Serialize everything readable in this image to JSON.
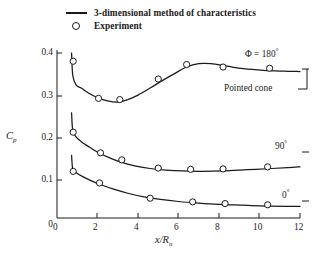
{
  "legend": {
    "items": [
      {
        "symbol": "line",
        "label": "3-dimensional method of characteristics"
      },
      {
        "symbol": "circle",
        "label": "Experiment"
      }
    ]
  },
  "axes": {
    "y": {
      "label_main": "C",
      "label_sub": "p",
      "ticks": [
        "0.4",
        "0.3",
        "0.2",
        "0.1",
        "0"
      ],
      "tick_values": [
        0.4,
        0.3,
        0.2,
        0.1,
        0.0
      ],
      "range": [
        0,
        0.4
      ]
    },
    "x": {
      "label_main": "x/R",
      "label_sub": "n",
      "ticks": [
        "0",
        "2",
        "4",
        "6",
        "8",
        "10",
        "12"
      ],
      "tick_values": [
        0,
        2,
        4,
        6,
        8,
        10,
        12
      ],
      "range": [
        0,
        12
      ]
    }
  },
  "annotations": {
    "phi180": {
      "text": "Φ = 180",
      "degree": "°"
    },
    "phi90": {
      "text": "90",
      "degree": "°"
    },
    "phi0": {
      "text": "0",
      "degree": "°"
    },
    "pointed_cone": "Pointed cone"
  },
  "chart_data": {
    "type": "line",
    "title": "",
    "xlabel": "x/R_n",
    "ylabel": "C_p",
    "xlim": [
      0,
      12
    ],
    "ylim": [
      0,
      0.4
    ],
    "grid": false,
    "legend_position": "top",
    "series": [
      {
        "name": "3-dimensional method of characteristics, Φ = 180°",
        "style": "line",
        "points": [
          [
            0.72,
            0.4
          ],
          [
            0.78,
            0.345
          ],
          [
            0.95,
            0.322
          ],
          [
            1.2,
            0.315
          ],
          [
            1.55,
            0.303
          ],
          [
            2.0,
            0.292
          ],
          [
            2.5,
            0.284
          ],
          [
            3.0,
            0.281
          ],
          [
            3.5,
            0.287
          ],
          [
            4.0,
            0.298
          ],
          [
            4.6,
            0.315
          ],
          [
            5.2,
            0.333
          ],
          [
            5.8,
            0.35
          ],
          [
            6.4,
            0.366
          ],
          [
            7.0,
            0.374
          ],
          [
            7.6,
            0.374
          ],
          [
            8.4,
            0.368
          ],
          [
            9.2,
            0.362
          ],
          [
            10.2,
            0.358
          ],
          [
            11.2,
            0.356
          ],
          [
            12.0,
            0.355
          ]
        ]
      },
      {
        "name": "3-dimensional method of characteristics, Φ = 90°",
        "style": "line",
        "points": [
          [
            0.72,
            0.255
          ],
          [
            0.78,
            0.212
          ],
          [
            0.95,
            0.196
          ],
          [
            1.2,
            0.185
          ],
          [
            1.6,
            0.172
          ],
          [
            2.1,
            0.157
          ],
          [
            2.6,
            0.146
          ],
          [
            3.2,
            0.135
          ],
          [
            3.9,
            0.126
          ],
          [
            4.6,
            0.12
          ],
          [
            5.4,
            0.116
          ],
          [
            6.2,
            0.114
          ],
          [
            7.2,
            0.113
          ],
          [
            8.2,
            0.114
          ],
          [
            9.4,
            0.117
          ],
          [
            10.6,
            0.12
          ],
          [
            11.4,
            0.122
          ],
          [
            12.0,
            0.124
          ]
        ]
      },
      {
        "name": "3-dimensional method of characteristics, Φ = 0°",
        "style": "line",
        "points": [
          [
            0.72,
            0.152
          ],
          [
            0.78,
            0.118
          ],
          [
            0.95,
            0.11
          ],
          [
            1.25,
            0.101
          ],
          [
            1.7,
            0.09
          ],
          [
            2.2,
            0.08
          ],
          [
            2.8,
            0.07
          ],
          [
            3.5,
            0.06
          ],
          [
            4.3,
            0.051
          ],
          [
            5.1,
            0.045
          ],
          [
            6.0,
            0.04
          ],
          [
            7.0,
            0.036
          ],
          [
            8.0,
            0.033
          ],
          [
            9.2,
            0.031
          ],
          [
            10.4,
            0.029
          ],
          [
            11.4,
            0.028
          ],
          [
            12.0,
            0.028
          ]
        ]
      },
      {
        "name": "Experiment, Φ = 180°",
        "style": "markers",
        "points": [
          [
            0.8,
            0.38
          ],
          [
            2.05,
            0.29
          ],
          [
            3.1,
            0.287
          ],
          [
            5.0,
            0.337
          ],
          [
            6.4,
            0.372
          ],
          [
            8.2,
            0.366
          ],
          [
            10.5,
            0.363
          ]
        ]
      },
      {
        "name": "Experiment, Φ = 90°",
        "style": "markers",
        "points": [
          [
            0.8,
            0.208
          ],
          [
            2.15,
            0.158
          ],
          [
            3.2,
            0.141
          ],
          [
            5.0,
            0.121
          ],
          [
            6.6,
            0.118
          ],
          [
            8.2,
            0.119
          ],
          [
            10.4,
            0.124
          ]
        ]
      },
      {
        "name": "Experiment, Φ = 0°",
        "style": "markers",
        "points": [
          [
            0.8,
            0.113
          ],
          [
            2.1,
            0.085
          ],
          [
            4.6,
            0.048
          ],
          [
            6.7,
            0.039
          ],
          [
            8.3,
            0.035
          ],
          [
            10.4,
            0.032
          ]
        ]
      }
    ]
  },
  "colors": {
    "ink": "#1a1a1a",
    "background": "#ffffff"
  }
}
